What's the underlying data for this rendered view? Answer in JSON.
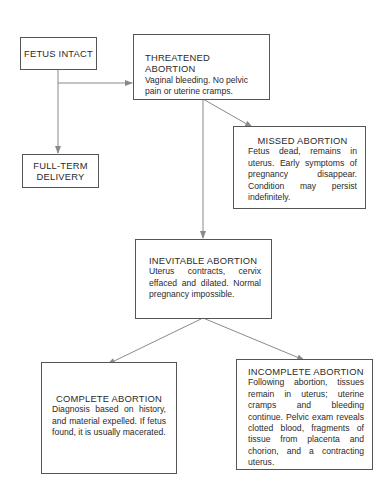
{
  "nodes": {
    "fetus_intact": {
      "title": "FETUS INTACT"
    },
    "threatened": {
      "title": "THREATENED ABORTION",
      "desc": "Vaginal bleeding. No pelvic pain or uterine cramps."
    },
    "missed": {
      "title": "MISSED ABORTION",
      "desc": "Fetus dead, remains in uterus. Early symptoms of pregnancy disappear. Condition may persist indefinitely."
    },
    "full_term": {
      "title_line1": "FULL-TERM",
      "title_line2": "DELIVERY"
    },
    "inevitable": {
      "title": "INEVITABLE ABORTION",
      "desc": "Uterus contracts, cervix effaced and dilated. Normal pregnancy impossible."
    },
    "complete": {
      "title": "COMPLETE ABORTION",
      "desc": "Diagnosis based on history, and material expelled. If fetus found, it is usually macerated."
    },
    "incomplete": {
      "title": "INCOMPLETE ABORTION",
      "desc": "Following abortion, tissues remain in uterus; uterine cramps and bleeding continue. Pelvic exam reveals clotted blood, fragments of tissue from placenta and chorion, and a contracting uterus."
    }
  },
  "edges": [
    {
      "from": "fetus_intact",
      "to": "threatened"
    },
    {
      "from": "fetus_intact",
      "to": "full_term"
    },
    {
      "from": "threatened",
      "to": "missed"
    },
    {
      "from": "threatened",
      "to": "inevitable"
    },
    {
      "from": "inevitable",
      "to": "complete"
    },
    {
      "from": "inevitable",
      "to": "incomplete"
    }
  ],
  "colors": {
    "line": "#8a8a8a",
    "border": "#555555"
  }
}
